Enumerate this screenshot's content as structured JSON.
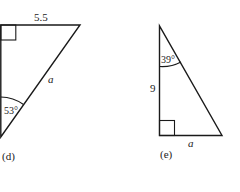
{
  "figures": [
    {
      "id": "d",
      "caption": "(d)",
      "side_top_label": "5.5",
      "hypotenuse_label": "a",
      "angle_label": "53°",
      "right_angle": "top-left"
    },
    {
      "id": "e",
      "caption": "(e)",
      "side_left_label": "9",
      "side_bottom_label": "a",
      "angle_label": "39°",
      "right_angle": "bottom-left"
    }
  ],
  "colors": {
    "stroke": "#1a1a1a",
    "background": "#ffffff"
  }
}
